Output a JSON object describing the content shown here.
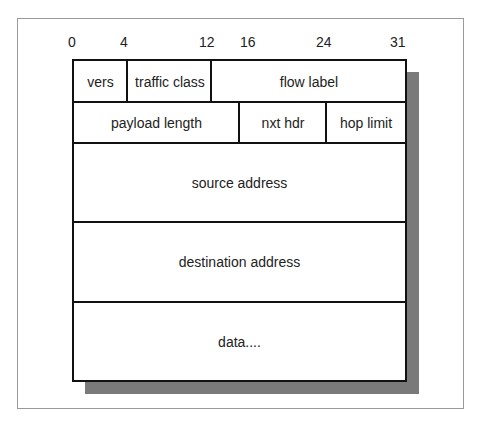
{
  "bit_positions": [
    "0",
    "4",
    "12",
    "16",
    "24",
    "31"
  ],
  "rows": [
    {
      "fields": [
        {
          "label": "vers"
        },
        {
          "label": "traffic class"
        },
        {
          "label": "flow label"
        }
      ]
    },
    {
      "fields": [
        {
          "label": "payload length"
        },
        {
          "label": "nxt hdr"
        },
        {
          "label": "hop limit"
        }
      ]
    },
    {
      "fields": [
        {
          "label": "source address"
        }
      ]
    },
    {
      "fields": [
        {
          "label": "destination address"
        }
      ]
    },
    {
      "fields": [
        {
          "label": "data...."
        }
      ]
    }
  ],
  "colors": {
    "border": "#111111",
    "shadow": "#7a7a7a",
    "frame": "#9a9a9a"
  }
}
